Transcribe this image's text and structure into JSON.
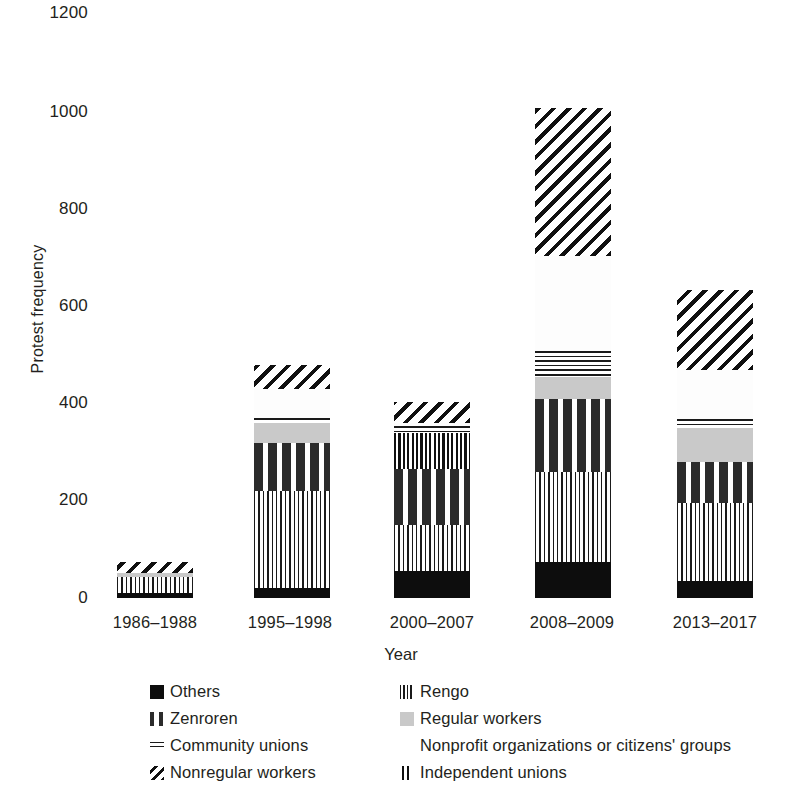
{
  "chart_data": {
    "type": "bar",
    "stacked": true,
    "title": "",
    "xlabel": "Year",
    "ylabel": "Protest frequency",
    "categories": [
      "1986–1988",
      "1995–1998",
      "2000–2007",
      "2008–2009",
      "2013–2017"
    ],
    "ylim": [
      0,
      1200
    ],
    "yticks": [
      0,
      200,
      400,
      600,
      800,
      1000,
      1200
    ],
    "ytick_labels": [
      "0",
      "200",
      "400",
      "600",
      "800",
      "1000",
      "1200"
    ],
    "grid": false,
    "legend_position": "below-axes",
    "series": [
      {
        "name": "Others",
        "pattern": "solid-black",
        "color": "#0d0d0d",
        "values": [
          10,
          20,
          55,
          75,
          35
        ]
      },
      {
        "name": "Rengo",
        "pattern": "vertical-lines",
        "color": "#1a1a1a",
        "values": [
          33,
          200,
          95,
          185,
          160
        ]
      },
      {
        "name": "Zenroren",
        "pattern": "dashes-dots",
        "color": "#2b2b2b",
        "values": [
          0,
          100,
          115,
          150,
          85
        ]
      },
      {
        "name": "Regular workers",
        "pattern": "solid-gray",
        "color": "#c9c9c9",
        "values": [
          9,
          40,
          0,
          45,
          70
        ]
      },
      {
        "name": "Independent unions",
        "pattern": "double-vertical",
        "color": "#101010",
        "values": [
          0,
          0,
          75,
          0,
          0
        ]
      },
      {
        "name": "Community unions",
        "pattern": "horizontal-lines",
        "color": "#1a1a1a",
        "values": [
          0,
          12,
          15,
          55,
          20
        ]
      },
      {
        "name": "Nonprofit organizations or citizens' groups",
        "pattern": "white",
        "color": "#fdfdfd",
        "values": [
          0,
          58,
          5,
          195,
          100
        ]
      },
      {
        "name": "Nonregular workers",
        "pattern": "diagonal-hatch",
        "color": "#101010",
        "values": [
          23,
          50,
          45,
          305,
          165
        ]
      }
    ],
    "totals": [
      75,
      680,
      410,
      1010,
      635
    ]
  },
  "axes": {
    "y_title": "Protest frequency",
    "x_title": "Year",
    "y_labels": [
      "1200",
      "1000",
      "800",
      "600",
      "400",
      "200",
      "0"
    ],
    "x_labels": [
      "1986–1988",
      "1995–1998",
      "2000–2007",
      "2008–2009",
      "2013–2017"
    ]
  },
  "legend": {
    "rows": [
      {
        "left": {
          "label": "Others",
          "swatch": "others-swatch"
        },
        "right": {
          "label": "Rengo",
          "swatch": "rengo-swatch"
        }
      },
      {
        "left": {
          "label": "Zenroren",
          "swatch": "zenroren-swatch"
        },
        "right": {
          "label": "Regular workers",
          "swatch": "regular-workers-swatch"
        }
      },
      {
        "left": {
          "label": "Community unions",
          "swatch": "community-unions-swatch"
        },
        "right": {
          "label": "Nonprofit organizations or citizens' groups",
          "swatch": "nonprofit-swatch"
        }
      },
      {
        "left": {
          "label": "Nonregular workers",
          "swatch": "nonregular-workers-swatch"
        },
        "right": {
          "label": "Independent unions",
          "swatch": "independent-unions-swatch"
        }
      }
    ]
  }
}
